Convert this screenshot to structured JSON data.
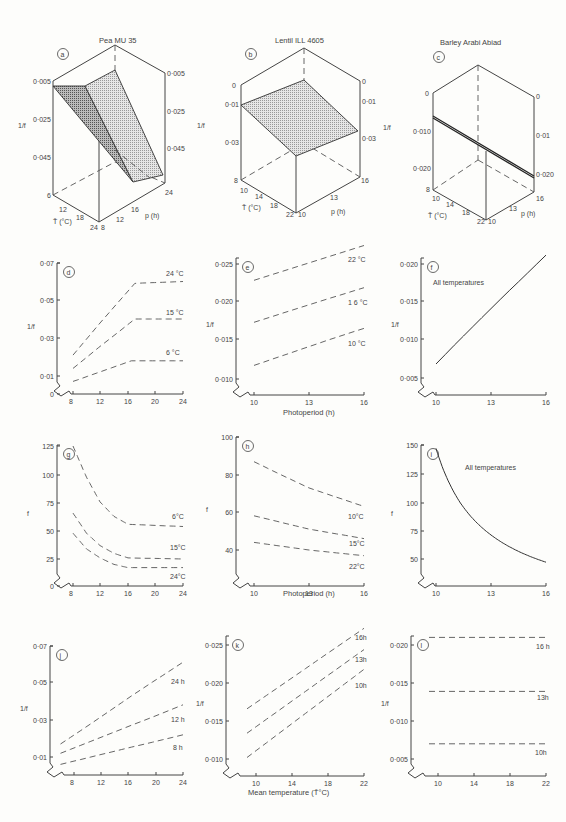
{
  "figure": {
    "panels_3d": {
      "a": {
        "letter": "a",
        "title": "Pea MU 35",
        "zlabel": "1/f",
        "z_ticks_left": [
          "0·005",
          "0·025",
          "0·045"
        ],
        "z_ticks_right": [
          "0·005",
          "0·025",
          "0·045"
        ],
        "t_label": "T̄ (°C)",
        "t_ticks": [
          "6",
          "12",
          "18",
          "24"
        ],
        "p_label": "p (h)",
        "p_ticks": [
          "8",
          "12",
          "16",
          "24"
        ]
      },
      "b": {
        "letter": "b",
        "title": "Lentil  ILL 4605",
        "zlabel": "1/f",
        "z_ticks_left": [
          "0",
          "0·01",
          "0·03"
        ],
        "z_ticks_right": [
          "0",
          "0·01",
          "0·03"
        ],
        "t_label": "T̄ (°C)",
        "t_ticks": [
          "8",
          "10",
          "14",
          "18",
          "22"
        ],
        "p_label": "p (h)",
        "p_ticks": [
          "10",
          "13",
          "16"
        ]
      },
      "c": {
        "letter": "c",
        "title": "Barley  Arabi Abiad",
        "zlabel": "1/f",
        "z_ticks_left": [
          "0",
          "0·010",
          "0·020"
        ],
        "z_ticks_right": [
          "0",
          "0·01",
          "0·020"
        ],
        "t_label": "T̄ (°C)",
        "t_ticks": [
          "8",
          "10",
          "14",
          "18",
          "22"
        ],
        "p_label": "p (h)",
        "p_ticks": [
          "10",
          "13",
          "16"
        ]
      }
    },
    "row_labels": {
      "photoperiod_e": "Photoperiod (h)",
      "photoperiod_h": "Photoperiod (h)",
      "mean_temp": "Mean temperature (T̄°C)"
    }
  },
  "chart_data": [
    {
      "panel": "d",
      "type": "line",
      "title": "",
      "xlabel": "",
      "ylabel": "1/f",
      "x_ticks": [
        "8",
        "12",
        "16",
        "20",
        "24"
      ],
      "y_ticks": [
        "0",
        "0·01",
        "0·03",
        "0·05",
        "0·07"
      ],
      "ylim": [
        0,
        0.07
      ],
      "xlim": [
        6,
        24
      ],
      "style": "dashed",
      "series": [
        {
          "name": "24 °C",
          "x": [
            8,
            17,
            24
          ],
          "y": [
            0.021,
            0.059,
            0.06
          ]
        },
        {
          "name": "15 °C",
          "x": [
            8,
            17,
            24
          ],
          "y": [
            0.014,
            0.04,
            0.04
          ]
        },
        {
          "name": "6 °C",
          "x": [
            8,
            16.5,
            24
          ],
          "y": [
            0.007,
            0.018,
            0.018
          ]
        }
      ]
    },
    {
      "panel": "e",
      "type": "line",
      "xlabel": "Photoperiod (h)",
      "ylabel": "1/f",
      "x_ticks": [
        "10",
        "13",
        "16"
      ],
      "y_ticks": [
        "0·010",
        "0·015",
        "0·020",
        "0·025"
      ],
      "ylim": [
        0.009,
        0.027
      ],
      "xlim": [
        9.2,
        16
      ],
      "style": "dashed",
      "series": [
        {
          "name": "22 °C",
          "x": [
            10,
            16
          ],
          "y": [
            0.0228,
            0.0275
          ]
        },
        {
          "name": "1 6 °C",
          "x": [
            10,
            16
          ],
          "y": [
            0.0172,
            0.0218
          ]
        },
        {
          "name": "10 °C",
          "x": [
            10,
            16
          ],
          "y": [
            0.0117,
            0.0164
          ]
        }
      ]
    },
    {
      "panel": "f",
      "type": "line",
      "xlabel": "",
      "ylabel": "1/f",
      "x_ticks": [
        "10",
        "13",
        "16"
      ],
      "y_ticks": [
        "0·005",
        "0·010",
        "0·015",
        "0·020"
      ],
      "ylim": [
        0.004,
        0.022
      ],
      "xlim": [
        9.2,
        16
      ],
      "style": "solid",
      "annotation": "All temperatures",
      "series": [
        {
          "name": "All temperatures",
          "x": [
            10,
            16
          ],
          "y": [
            0.0068,
            0.0212
          ]
        }
      ]
    },
    {
      "panel": "g",
      "type": "line",
      "xlabel": "",
      "ylabel": "f",
      "x_ticks": [
        "8",
        "12",
        "16",
        "20",
        "24"
      ],
      "y_ticks": [
        "0",
        "25",
        "50",
        "75",
        "100",
        "125"
      ],
      "ylim": [
        0,
        125
      ],
      "xlim": [
        6,
        24
      ],
      "style": "dashed",
      "series": [
        {
          "name": "6°C",
          "x": [
            8,
            10,
            12,
            14,
            16,
            24
          ],
          "y": [
            125,
            98,
            76,
            63,
            56,
            54
          ]
        },
        {
          "name": "15°C",
          "x": [
            8,
            10,
            12,
            14,
            16,
            24
          ],
          "y": [
            66,
            48,
            37,
            30,
            26,
            25
          ]
        },
        {
          "name": "24°C",
          "x": [
            8,
            10,
            12,
            14,
            16,
            24
          ],
          "y": [
            48,
            34,
            26,
            20,
            17,
            17
          ]
        }
      ]
    },
    {
      "panel": "h",
      "type": "line",
      "xlabel": "Photoperiod (h)",
      "ylabel": "f",
      "x_ticks": [
        "10",
        "13",
        "16"
      ],
      "y_ticks": [
        "40",
        "60",
        "80",
        "100"
      ],
      "ylim": [
        28,
        100
      ],
      "xlim": [
        9.2,
        16
      ],
      "style": "dashed",
      "series": [
        {
          "name": "10°C",
          "x": [
            10,
            13,
            16
          ],
          "y": [
            87,
            73,
            63
          ]
        },
        {
          "name": "15°C",
          "x": [
            10,
            13,
            16
          ],
          "y": [
            58,
            51,
            46
          ]
        },
        {
          "name": "22°C",
          "x": [
            10,
            13,
            16
          ],
          "y": [
            44,
            40,
            37
          ]
        }
      ]
    },
    {
      "panel": "i",
      "type": "line",
      "xlabel": "",
      "ylabel": "f",
      "x_ticks": [
        "10",
        "13",
        "16"
      ],
      "y_ticks": [
        "50",
        "75",
        "100",
        "125",
        "150"
      ],
      "ylim": [
        36,
        150
      ],
      "xlim": [
        9.2,
        16
      ],
      "style": "solid",
      "annotation": "All temperatures",
      "series": [
        {
          "name": "All temperatures",
          "x": [
            10,
            11,
            12,
            13,
            14,
            15,
            16
          ],
          "y": [
            147,
            109,
            86,
            71,
            60,
            52,
            46
          ]
        }
      ]
    },
    {
      "panel": "j",
      "type": "line",
      "xlabel": "",
      "ylabel": "1/f",
      "x_ticks": [
        "8",
        "12",
        "16",
        "20",
        "24"
      ],
      "y_ticks": [
        "0·01",
        "0·03",
        "0·05",
        "0·07"
      ],
      "ylim": [
        0,
        0.07
      ],
      "xlim": [
        5,
        24
      ],
      "style": "dashed",
      "series": [
        {
          "name": "24 h",
          "x": [
            6,
            24
          ],
          "y": [
            0.017,
            0.061
          ]
        },
        {
          "name": "12 h",
          "x": [
            6,
            24
          ],
          "y": [
            0.012,
            0.038
          ]
        },
        {
          "name": "8 h",
          "x": [
            6,
            24
          ],
          "y": [
            0.006,
            0.022
          ]
        }
      ]
    },
    {
      "panel": "k",
      "type": "line",
      "xlabel": "Mean temperature (T̄°C)",
      "ylabel": "1/f",
      "x_ticks": [
        "10",
        "14",
        "18",
        "22"
      ],
      "y_ticks": [
        "0·010",
        "0·015",
        "0·020",
        "0·025"
      ],
      "ylim": [
        0.009,
        0.027
      ],
      "xlim": [
        7.5,
        22
      ],
      "style": "dashed",
      "series": [
        {
          "name": "16h",
          "x": [
            9,
            22
          ],
          "y": [
            0.0166,
            0.0272
          ]
        },
        {
          "name": "13h",
          "x": [
            9,
            22
          ],
          "y": [
            0.0134,
            0.0244
          ]
        },
        {
          "name": "10h",
          "x": [
            9,
            22
          ],
          "y": [
            0.0102,
            0.0218
          ]
        }
      ]
    },
    {
      "panel": "l",
      "type": "line",
      "xlabel": "",
      "ylabel": "1/f",
      "x_ticks": [
        "10",
        "14",
        "18",
        "22"
      ],
      "y_ticks": [
        "0·005",
        "0·010",
        "0·015",
        "0·020"
      ],
      "ylim": [
        0.004,
        0.022
      ],
      "xlim": [
        7.5,
        22
      ],
      "style": "dashed",
      "series": [
        {
          "name": "16 h",
          "x": [
            9,
            22
          ],
          "y": [
            0.021,
            0.021
          ]
        },
        {
          "name": "13h",
          "x": [
            9,
            22
          ],
          "y": [
            0.0139,
            0.0139
          ]
        },
        {
          "name": "10h",
          "x": [
            9,
            22
          ],
          "y": [
            0.007,
            0.007
          ]
        }
      ]
    }
  ]
}
